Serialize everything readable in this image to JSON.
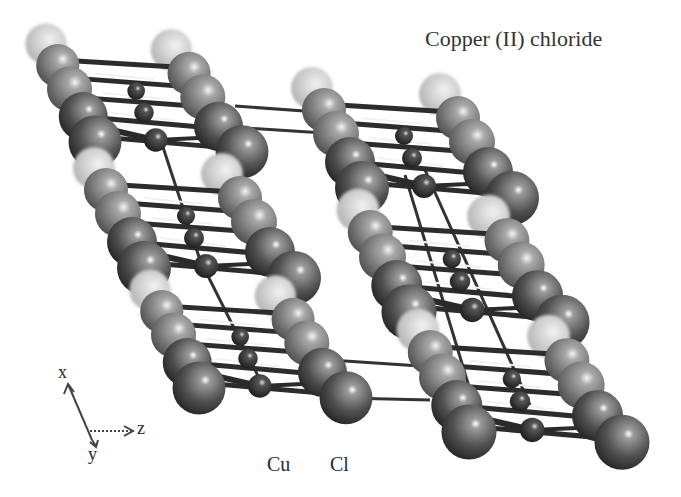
{
  "figure": {
    "title": "Copper (II) chloride",
    "legend": {
      "cu_label": "Cu",
      "cl_label": "Cl"
    },
    "axes": {
      "x_label": "x",
      "y_label": "y",
      "z_label": "z"
    },
    "colors": {
      "background": "#ffffff",
      "cl_dark": "#3a3a3a",
      "cl_light": "#cfcfcf",
      "cu": "#2a2a2a",
      "bond": "#333333",
      "text": "#2a2a2a"
    }
  }
}
